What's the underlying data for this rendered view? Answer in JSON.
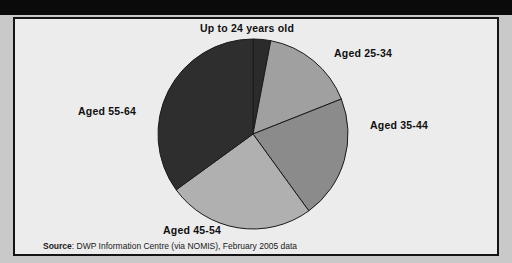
{
  "window": {
    "title_strip_color": "#0a0a0a",
    "title": ""
  },
  "figure": {
    "background": "#ececed",
    "border_color": "#141414",
    "source_label": "Source",
    "source_separator": ": ",
    "source_text": "DWP Information Centre (via NOMIS), February 2005 data"
  },
  "chart_data": {
    "type": "pie",
    "title": "",
    "xlabel": "",
    "ylabel": "",
    "legend_position": "outside-labels",
    "grid": false,
    "categories": [
      "Up to 24 years old",
      "Aged 25-34",
      "Aged 35-44",
      "Aged 45-54",
      "Aged 55-64"
    ],
    "values": [
      3,
      16,
      21,
      25,
      35
    ],
    "units": "percent",
    "start_angle_deg": 0,
    "direction": "clockwise",
    "slice_angles_deg": [
      11,
      59,
      76,
      90,
      124
    ],
    "colors": [
      "#2b2b2b",
      "#a0a0a0",
      "#8b8b8b",
      "#b0b0b0",
      "#2e2e2e"
    ],
    "edge_color": "#1a1a1a",
    "labels": [
      {
        "name": "Up to 24 years old",
        "value": 3,
        "color": "#2b2b2b"
      },
      {
        "name": "Aged 25-34",
        "value": 16,
        "color": "#a0a0a0"
      },
      {
        "name": "Aged 35-44",
        "value": 21,
        "color": "#8b8b8b"
      },
      {
        "name": "Aged 45-54",
        "value": 25,
        "color": "#b0b0b0"
      },
      {
        "name": "Aged 55-64",
        "value": 35,
        "color": "#2e2e2e"
      }
    ]
  }
}
